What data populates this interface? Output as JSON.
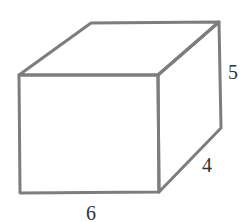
{
  "diagram": {
    "type": "rectangular-prism",
    "stroke_color": "#7d7d7d",
    "labels": {
      "width": "6",
      "depth": "4",
      "height": "5"
    },
    "vertices": {
      "front_top_left": [
        19,
        75
      ],
      "front_top_right": [
        158,
        75
      ],
      "front_bottom_right": [
        159,
        192
      ],
      "front_bottom_left": [
        20,
        193
      ],
      "back_top_left": [
        91,
        23
      ],
      "back_top_right": [
        219,
        22
      ],
      "back_bottom_right": [
        221,
        128
      ]
    }
  }
}
